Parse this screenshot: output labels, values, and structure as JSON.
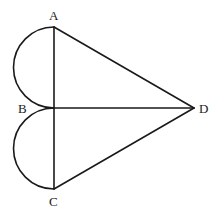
{
  "diagram": {
    "type": "geometry",
    "points": {
      "A": {
        "label": "A",
        "x": 54,
        "y": 27
      },
      "B": {
        "label": "B",
        "x": 54,
        "y": 108
      },
      "C": {
        "label": "C",
        "x": 54,
        "y": 189
      },
      "D": {
        "label": "D",
        "x": 194,
        "y": 108
      }
    },
    "segments": [
      {
        "from": "A",
        "to": "C",
        "name": "AC"
      },
      {
        "from": "A",
        "to": "D",
        "name": "AD"
      },
      {
        "from": "B",
        "to": "D",
        "name": "BD"
      },
      {
        "from": "C",
        "to": "D",
        "name": "CD"
      }
    ],
    "arcs": [
      {
        "name": "semicircle-AB",
        "from": "A",
        "to": "B",
        "radius": 40.5,
        "side": "left"
      },
      {
        "name": "semicircle-BC",
        "from": "B",
        "to": "C",
        "radius": 40.5,
        "side": "left"
      }
    ],
    "stroke_color": "#1a1a1a",
    "background_color": "#ffffff"
  }
}
